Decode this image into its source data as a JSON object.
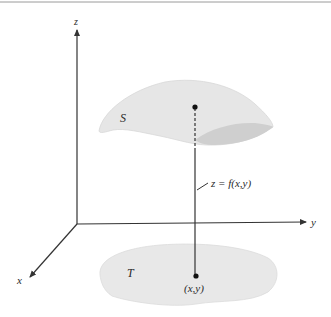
{
  "figure": {
    "axes": {
      "x_label": "x",
      "y_label": "y",
      "z_label": "z"
    },
    "surface": {
      "label": "S"
    },
    "region": {
      "label": "T"
    },
    "point_label": "(x,y)",
    "function_label": "z = f(x,y)",
    "colors": {
      "surface_fill": "#e6e6e6",
      "surface_shadow": "#cfcfcf",
      "region_fill": "#e8e8e8",
      "lines": "#333333",
      "top_rule": "#9a9a9a"
    }
  }
}
